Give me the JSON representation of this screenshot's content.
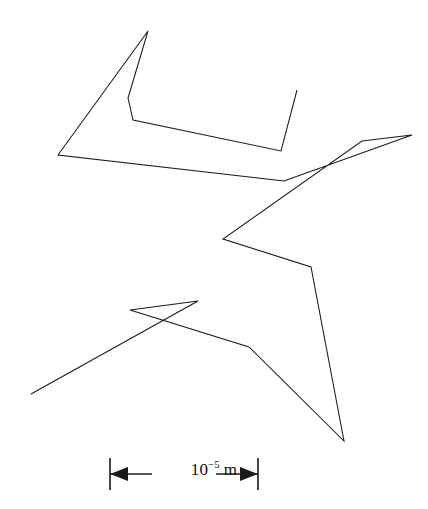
{
  "figure": {
    "name": "brownian-motion-random-walk",
    "background_color": "#ffffff",
    "stroke_color": "#1a1a1a",
    "width": 428,
    "height": 509
  },
  "scale_bar": {
    "label_mantissa": "10",
    "label_exponent": "−5",
    "label_unit": "m",
    "label_full": "10−5 m",
    "left_tick_x": 110,
    "right_tick_x": 258,
    "tick_top_y": 458,
    "tick_bottom_y": 490,
    "axis_y": 474,
    "left_arrow_tip_x": 122,
    "right_arrow_tip_x": 246,
    "pixel_length": 148
  },
  "chart_data": {
    "type": "line",
    "title": "",
    "subtitle": "",
    "xlabel": "",
    "ylabel": "",
    "grid": false,
    "legend": null,
    "axis_visible": false,
    "annotations": [
      {
        "kind": "scale-bar",
        "text": "10−5 m",
        "x_start": 110,
        "x_end": 258,
        "y": 474
      }
    ],
    "series": [
      {
        "name": "random-walk-trajectory",
        "closed": false,
        "points": [
          [
            297,
            90
          ],
          [
            281,
            151
          ],
          [
            133,
            120
          ],
          [
            128,
            98
          ],
          [
            148,
            31
          ],
          [
            58,
            155
          ],
          [
            284,
            181
          ],
          [
            412,
            135
          ],
          [
            362,
            141
          ],
          [
            223,
            239
          ],
          [
            311,
            267
          ],
          [
            344,
            441
          ],
          [
            249,
            347
          ],
          [
            130,
            310
          ],
          [
            198,
            301
          ],
          [
            31,
            394
          ]
        ]
      }
    ],
    "xlim": [
      0,
      428
    ],
    "ylim": [
      0,
      509
    ],
    "vertex_count": 16,
    "segment_count": 15
  }
}
